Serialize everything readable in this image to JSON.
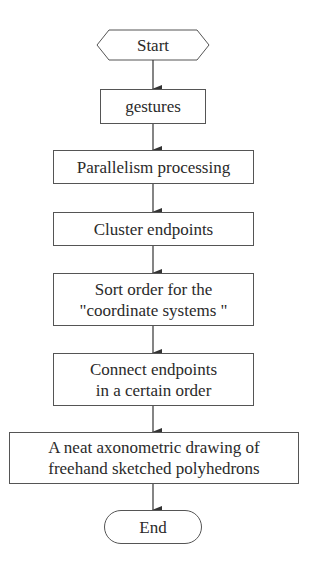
{
  "flowchart": {
    "start": {
      "label": "Start",
      "shape": "hexagon"
    },
    "steps": [
      {
        "label": "gestures"
      },
      {
        "label": "Parallelism processing"
      },
      {
        "label": "Cluster endpoints"
      },
      {
        "label": "Sort order for the\n\"coordinate systems \""
      },
      {
        "label": "Connect endpoints\nin a certain order"
      },
      {
        "label": "A neat axonometric drawing of\nfreehand sketched polyhedrons"
      }
    ],
    "end": {
      "label": "End",
      "shape": "rounded"
    },
    "colors": {
      "stroke": "#555555",
      "text": "#2a2a2a",
      "background": "#ffffff"
    }
  }
}
